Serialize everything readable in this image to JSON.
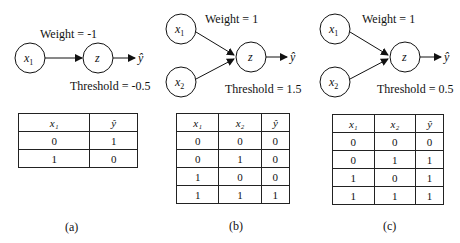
{
  "panels": [
    {
      "id": "a",
      "caption": "(a)",
      "weight_label": "Weight = -1",
      "threshold_label": "Threshold = -0.5",
      "inputs": [
        "x1"
      ],
      "node": "z",
      "output": "ŷ",
      "table": {
        "headers": [
          "x₁",
          "ŷ"
        ],
        "rows": [
          [
            "0",
            "1"
          ],
          [
            "1",
            "0"
          ]
        ]
      }
    },
    {
      "id": "b",
      "caption": "(b)",
      "weight_label": "Weight = 1",
      "threshold_label": "Threshold = 1.5",
      "inputs": [
        "x1",
        "x2"
      ],
      "node": "z",
      "output": "ŷ",
      "table": {
        "headers": [
          "x₁",
          "x₂",
          "ŷ"
        ],
        "rows": [
          [
            "0",
            "0",
            "0"
          ],
          [
            "0",
            "1",
            "0"
          ],
          [
            "1",
            "0",
            "0"
          ],
          [
            "1",
            "1",
            "1"
          ]
        ]
      }
    },
    {
      "id": "c",
      "caption": "(c)",
      "weight_label": "Weight = 1",
      "threshold_label": "Threshold = 0.5",
      "inputs": [
        "x1",
        "x2"
      ],
      "node": "z",
      "output": "ŷ",
      "table": {
        "headers": [
          "x₁",
          "x₂",
          "ŷ"
        ],
        "rows": [
          [
            "0",
            "0",
            "0"
          ],
          [
            "0",
            "1",
            "1"
          ],
          [
            "1",
            "0",
            "1"
          ],
          [
            "1",
            "1",
            "1"
          ]
        ]
      }
    }
  ],
  "labels": {
    "x1": "x",
    "x1_sub": "1",
    "x2": "x",
    "x2_sub": "2",
    "z": "z",
    "yhat": "ŷ"
  }
}
